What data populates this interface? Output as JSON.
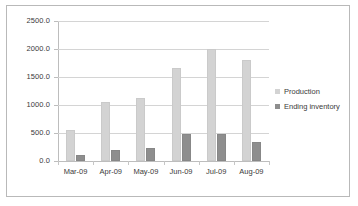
{
  "chart_data": {
    "type": "bar",
    "title": "",
    "xlabel": "",
    "ylabel": "",
    "ylim": [
      0,
      2500
    ],
    "ytick_step": 500,
    "grid": true,
    "legend_position": "right",
    "categories": [
      "Mar-09",
      "Apr-09",
      "May-09",
      "Jun-09",
      "Jul-09",
      "Aug-09"
    ],
    "ytick_labels": [
      "0.0",
      "500.0",
      "1000.0",
      "1500.0",
      "2000.0",
      "2500.0"
    ],
    "series": [
      {
        "name": "Production",
        "color": "#d3d3d3",
        "values": [
          550,
          1050,
          1130,
          1660,
          2000,
          1800
        ]
      },
      {
        "name": "Ending inventory",
        "color": "#8e8e8e",
        "values": [
          100,
          200,
          225,
          480,
          480,
          340
        ]
      }
    ]
  }
}
